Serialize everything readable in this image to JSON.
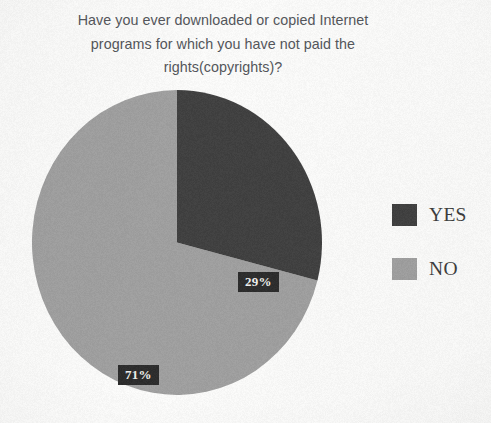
{
  "title": {
    "lines": [
      "Have you ever downloaded or copied Internet",
      "programs for which you have not paid the",
      "rights(copyrights)?"
    ],
    "full": "Have you ever downloaded or copied Internet programs for which you have not paid the rights(copyrights)?"
  },
  "labels": {
    "yes": "29%",
    "no": "71%"
  },
  "legend": {
    "items": [
      {
        "label": "YES",
        "color": "#3f3f3f"
      },
      {
        "label": "NO",
        "color": "#a0a0a0"
      }
    ]
  },
  "colors": {
    "yes": "#3f3f3f",
    "no": "#a0a0a0",
    "label_text": "#f2f2f0",
    "label_box": "#2b2b2b",
    "title_text": "#53555a",
    "legend_text": "#3b3b3b",
    "background": "#fdfdfc"
  },
  "chart_data": {
    "type": "pie",
    "title": "Have you ever downloaded or copied Internet programs for which you have not paid the rights(copyrights)?",
    "xlabel": "",
    "ylabel": "",
    "grid": false,
    "legend_position": "right",
    "start_angle": 90,
    "direction": "clockwise",
    "categories": [
      "YES",
      "NO"
    ],
    "values": [
      29,
      71
    ],
    "value_unit": "percent",
    "data_labels": [
      "29%",
      "71%"
    ],
    "slice_colors": [
      "#3f3f3f",
      "#a0a0a0"
    ],
    "slices": [
      {
        "name": "YES",
        "value": 29,
        "label": "29%",
        "color": "#3f3f3f",
        "angle_deg": 104.4
      },
      {
        "name": "NO",
        "value": 71,
        "label": "71%",
        "color": "#a0a0a0",
        "angle_deg": 255.6
      }
    ]
  }
}
